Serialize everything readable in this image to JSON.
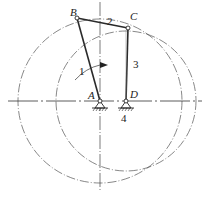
{
  "diagram": {
    "type": "four-bar linkage (crank-rocker)",
    "colors": {
      "line": "#2a2a2a",
      "construction": "#555555",
      "background": "#ffffff"
    },
    "points": {
      "A": {
        "label": "A",
        "x": 100,
        "y": 101
      },
      "B": {
        "label": "B",
        "x": 77,
        "y": 18
      },
      "C": {
        "label": "C",
        "x": 128,
        "y": 28
      },
      "D": {
        "label": "D",
        "x": 126,
        "y": 101
      }
    },
    "links": [
      {
        "id": "1",
        "label": "1",
        "from": "A",
        "to": "B",
        "name": "crank"
      },
      {
        "id": "2",
        "label": "2",
        "from": "B",
        "to": "C",
        "name": "coupler"
      },
      {
        "id": "3",
        "label": "3",
        "from": "C",
        "to": "D",
        "name": "rocker"
      },
      {
        "id": "4",
        "label": "4",
        "from": "A",
        "to": "D",
        "name": "frame"
      }
    ],
    "circles": [
      {
        "center": "A",
        "radius": 82,
        "style": "dash-dot"
      },
      {
        "center": "D",
        "radius": 70,
        "style": "dash-dot"
      }
    ],
    "rotation_arrow": {
      "near_link": "1",
      "direction": "clockwise"
    },
    "labels": {
      "A": "A",
      "B": "B",
      "C": "C",
      "D": "D",
      "link1": "1",
      "link2": "2",
      "link3": "3",
      "link4": "4"
    }
  }
}
